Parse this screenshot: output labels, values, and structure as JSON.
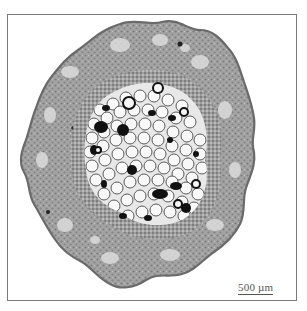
{
  "figure": {
    "scale_bar": {
      "label": "500 µm"
    },
    "colors": {
      "frame": "#7a7a7a",
      "cortex": "#9a9a9a",
      "cortex_dark": "#6e6e6e",
      "epidermis": "#8c8c8c",
      "pith_cell": "#f4f4f4",
      "pith_wall": "#5a5a5a",
      "dark_cells": "#111111",
      "background": "#ffffff"
    }
  }
}
